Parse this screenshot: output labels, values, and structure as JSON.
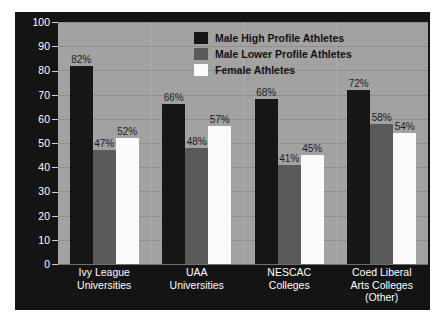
{
  "chart_data": {
    "type": "bar",
    "title": "",
    "subtitle": "",
    "xlabel": "",
    "ylabel": "Percent of Athletes Who Are Recruited",
    "ylim": [
      0,
      100
    ],
    "yticks": [
      0,
      10,
      20,
      30,
      40,
      50,
      60,
      70,
      80,
      90,
      100
    ],
    "ytick_labels": [
      "0",
      "10",
      "20",
      "30",
      "40",
      "50",
      "60",
      "70",
      "80",
      "90",
      "100"
    ],
    "grid": true,
    "grid_axis": "y",
    "legend_position": "top-center-inside",
    "value_label_suffix": "%",
    "categories": [
      "Ivy League Universities",
      "UAA Universities",
      "NESCAC Colleges",
      "Coed Liberal Arts Colleges (Other)"
    ],
    "category_lines": [
      [
        "Ivy League",
        "Universities",
        ""
      ],
      [
        "UAA",
        "Universities",
        ""
      ],
      [
        "NESCAC",
        "Colleges",
        ""
      ],
      [
        "Coed Liberal",
        "Arts Colleges",
        "(Other)"
      ]
    ],
    "series": [
      {
        "name": "Male High Profile Athletes",
        "color": "#161616",
        "values": [
          82,
          66,
          68,
          72
        ],
        "value_labels": [
          "82%",
          "66%",
          "68%",
          "72%"
        ]
      },
      {
        "name": "Male Lower Profile Athletes",
        "color": "#5a5a5a",
        "values": [
          47,
          48,
          41,
          58
        ],
        "value_labels": [
          "47%",
          "48%",
          "41%",
          "58%"
        ]
      },
      {
        "name": "Female Athletes",
        "color": "#fbfbfb",
        "values": [
          52,
          57,
          45,
          54
        ],
        "value_labels": [
          "52%",
          "57%",
          "45%",
          "54%"
        ]
      }
    ],
    "colors": {
      "figure_background": "#141414",
      "plot_background": "#a2a2a2",
      "gridline": "#8e8e8e",
      "axis_text": "#ffffff",
      "value_label_text": "#1d1d1d",
      "legend_text": "#111111"
    }
  },
  "legend": {
    "items": [
      {
        "label": "Male High Profile Athletes",
        "color": "#161616"
      },
      {
        "label": "Male Lower Profile Athletes",
        "color": "#5a5a5a"
      },
      {
        "label": "Female Athletes",
        "color": "#fbfbfb"
      }
    ]
  }
}
